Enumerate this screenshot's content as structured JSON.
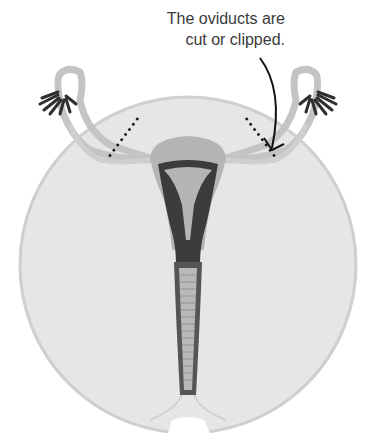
{
  "diagram": {
    "annotation": {
      "line1": "The oviducts are",
      "line2": "cut or clipped."
    },
    "labels_semantic": [
      "oviduct-left",
      "oviduct-right",
      "fimbriae-left",
      "fimbriae-right",
      "uterus",
      "cervix",
      "vagina",
      "cut-line-left",
      "cut-line-right",
      "pointer-arrow"
    ],
    "colors": {
      "background_circle": "#e6e6e6",
      "circle_edge": "#cfcfcf",
      "tube": "#c4c4c4",
      "uterus_outer": "#b5b5b5",
      "uterus_inner": "#3c3c3c",
      "fimbriae": "#2e2e2e",
      "text": "#3a3a3a"
    }
  }
}
